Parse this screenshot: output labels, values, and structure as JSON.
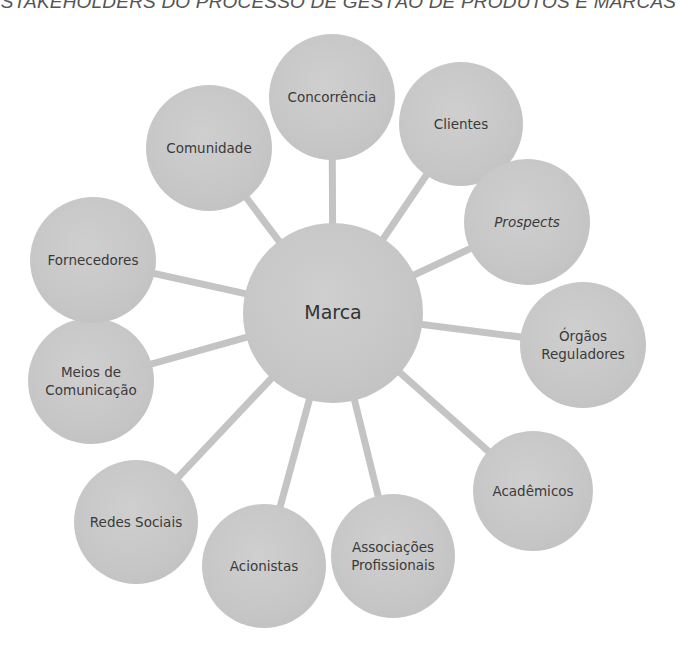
{
  "title": "STAKEHOLDERS DO PROCESSO DE GESTÃO DE PRODUTOS E MARCAS",
  "colors": {
    "node_fill": "#c6c6c6",
    "connector": "#c4c4c4",
    "text": "#3a3a3a",
    "background": "#ffffff"
  },
  "center_node": {
    "label": "Marca",
    "cx": 333,
    "cy": 313,
    "r": 90
  },
  "nodes": [
    {
      "id": "concorrencia",
      "label": "Concorrência",
      "italic": false,
      "cx": 332,
      "cy": 97,
      "r": 63
    },
    {
      "id": "clientes",
      "label": "Clientes",
      "italic": false,
      "cx": 461,
      "cy": 124,
      "r": 62
    },
    {
      "id": "prospects",
      "label": "Prospects",
      "italic": true,
      "cx": 527,
      "cy": 222,
      "r": 63
    },
    {
      "id": "orgaos-reguladores",
      "label": "Órgãos\nReguladores",
      "italic": false,
      "cx": 583,
      "cy": 345,
      "r": 63
    },
    {
      "id": "academicos",
      "label": "Acadêmicos",
      "italic": false,
      "cx": 533,
      "cy": 491,
      "r": 60
    },
    {
      "id": "associacoes-profissionais",
      "label": "Associações\nProfissionais",
      "italic": false,
      "cx": 393,
      "cy": 556,
      "r": 62
    },
    {
      "id": "acionistas",
      "label": "Acionistas",
      "italic": false,
      "cx": 264,
      "cy": 566,
      "r": 62
    },
    {
      "id": "redes-sociais",
      "label": "Redes Sociais",
      "italic": false,
      "cx": 136,
      "cy": 522,
      "r": 62
    },
    {
      "id": "meios-de-comunicacao",
      "label": "Meios de\nComunicação",
      "italic": false,
      "cx": 91,
      "cy": 381,
      "r": 63
    },
    {
      "id": "fornecedores",
      "label": "Fornecedores",
      "italic": false,
      "cx": 93,
      "cy": 260,
      "r": 63
    },
    {
      "id": "comunidade",
      "label": "Comunidade",
      "italic": false,
      "cx": 209,
      "cy": 148,
      "r": 63
    }
  ]
}
